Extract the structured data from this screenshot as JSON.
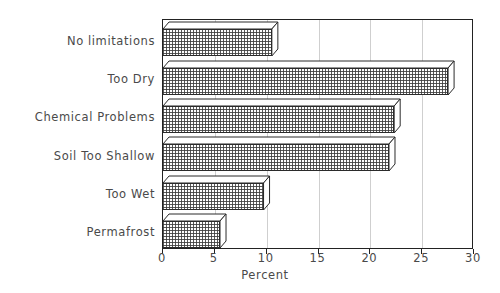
{
  "chart_data": {
    "type": "bar",
    "orientation": "horizontal",
    "title": "",
    "xlabel": "Percent",
    "ylabel": "",
    "categories": [
      "No limitations",
      "Too Dry",
      "Chemical Problems",
      "Soil Too Shallow",
      "Too Wet",
      "Permafrost"
    ],
    "values": [
      10.5,
      27.5,
      22.3,
      21.8,
      9.7,
      5.5
    ],
    "xlim": [
      0,
      30
    ],
    "xticks": [
      0,
      5,
      10,
      15,
      20,
      25,
      30
    ],
    "xtick_labels": [
      "0",
      "5",
      "10",
      "15",
      "20",
      "25",
      "30"
    ],
    "grid": true,
    "grid_axis": "x",
    "legend": false,
    "style": "3d-shadow-bars",
    "bar_fill": "crosshatch",
    "colors": {
      "frame": "#222222",
      "grid": "#cfcfcf",
      "bar_edge": "#2b2b2b",
      "bar_fill": "#ffffff",
      "text": "#4a4a4a",
      "background": "#ffffff"
    }
  }
}
